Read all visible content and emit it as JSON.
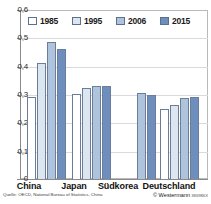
{
  "chart_data": {
    "type": "bar",
    "title": "",
    "subtitle": "",
    "xlabel": "",
    "ylabel": "",
    "ylim": [
      0,
      0.6
    ],
    "ytick_labels": [
      "0,6",
      "0,5",
      "0,4",
      "0,3",
      "0,2",
      "0,1",
      "0"
    ],
    "ytick_values": [
      0.6,
      0.5,
      0.4,
      0.3,
      0.2,
      0.1,
      0
    ],
    "grid": true,
    "grid_axis": "y",
    "legend_position": "top-inside",
    "decimal_separator": ",",
    "categories": [
      "China",
      "Japan",
      "Südkorea",
      "Deutschland"
    ],
    "series": [
      {
        "name": "1985",
        "color": "#ffffff",
        "values": [
          0.292,
          0.303,
          null,
          0.25
        ]
      },
      {
        "name": "1995",
        "color": "#dce6f1",
        "values": [
          0.413,
          0.322,
          null,
          0.262
        ]
      },
      {
        "name": "2006",
        "color": "#aec3dc",
        "values": [
          0.486,
          0.33,
          0.304,
          0.289
        ]
      },
      {
        "name": "2015",
        "color": "#6e8fbe",
        "values": [
          0.461,
          0.331,
          0.297,
          0.292
        ]
      }
    ],
    "annotations": []
  },
  "legend": {
    "items": [
      {
        "label": "1985",
        "color": "#ffffff"
      },
      {
        "label": "1995",
        "color": "#dce6f1"
      },
      {
        "label": "2006",
        "color": "#aec3dc"
      },
      {
        "label": "2015",
        "color": "#6e8fbe"
      }
    ]
  },
  "axis": {
    "y_ticks": [
      {
        "label": "0,6"
      },
      {
        "label": "0,5"
      },
      {
        "label": "0,4"
      },
      {
        "label": "0,3"
      },
      {
        "label": "0,2"
      },
      {
        "label": "0,1"
      },
      {
        "label": "0"
      }
    ],
    "x_labels": [
      "China",
      "Japan",
      "Südkorea",
      "Deutschland"
    ]
  },
  "footer": {
    "source": "Quelle: OECD, National Bureau of Statistics, China",
    "copyright": "© Westermann",
    "code": "386986X"
  },
  "colors": {
    "axis": "#8a8a8a",
    "frame": "#b9b9b9",
    "grid": "#dadada",
    "bar_outline": "#6b7d99",
    "text": "#1a1a1a"
  }
}
